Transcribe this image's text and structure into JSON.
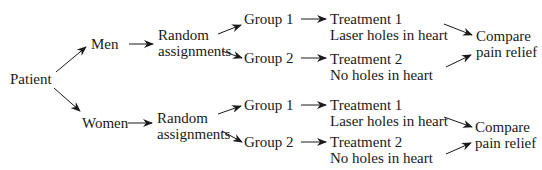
{
  "diagram": {
    "type": "flow",
    "colors": {
      "text": "#1a1a1a",
      "arrow": "#1a1a1a",
      "background": "#ffffff"
    },
    "root": {
      "label": "Patient"
    },
    "blocks": [
      {
        "label": "Men",
        "randomization": [
          "Random",
          "assignments"
        ],
        "groups": [
          {
            "label": "Group 1",
            "treatment": [
              "Treatment 1",
              "Laser holes in heart"
            ]
          },
          {
            "label": "Group 2",
            "treatment": [
              "Treatment 2",
              "No holes in heart"
            ]
          }
        ],
        "outcome": [
          "Compare",
          "pain relief"
        ]
      },
      {
        "label": "Women",
        "randomization": [
          "Random",
          "assignments"
        ],
        "groups": [
          {
            "label": "Group 1",
            "treatment": [
              "Treatment 1",
              "Laser holes in heart"
            ]
          },
          {
            "label": "Group 2",
            "treatment": [
              "Treatment 2",
              "No holes in heart"
            ]
          }
        ],
        "outcome": [
          "Compare",
          "pain relief"
        ]
      }
    ]
  }
}
